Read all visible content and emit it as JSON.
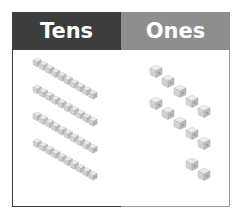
{
  "headers": {
    "tens": "Tens",
    "ones": "Ones"
  },
  "colors": {
    "tens_header": "#3d3d3d",
    "ones_header": "#8e8e8e",
    "cube": "#d9d9d9"
  },
  "place_value": {
    "tens_rods": 4,
    "ones_cubes": 12
  },
  "tens_rods": [
    {
      "x": 33,
      "y": 60
    },
    {
      "x": 33,
      "y": 87
    },
    {
      "x": 33,
      "y": 114
    },
    {
      "x": 33,
      "y": 141
    }
  ],
  "ones_cubes": [
    {
      "x": 150,
      "y": 68
    },
    {
      "x": 162,
      "y": 78
    },
    {
      "x": 174,
      "y": 88
    },
    {
      "x": 186,
      "y": 98
    },
    {
      "x": 198,
      "y": 108
    },
    {
      "x": 150,
      "y": 100
    },
    {
      "x": 162,
      "y": 110
    },
    {
      "x": 174,
      "y": 120
    },
    {
      "x": 186,
      "y": 130
    },
    {
      "x": 198,
      "y": 140
    },
    {
      "x": 186,
      "y": 161
    },
    {
      "x": 198,
      "y": 171
    }
  ]
}
